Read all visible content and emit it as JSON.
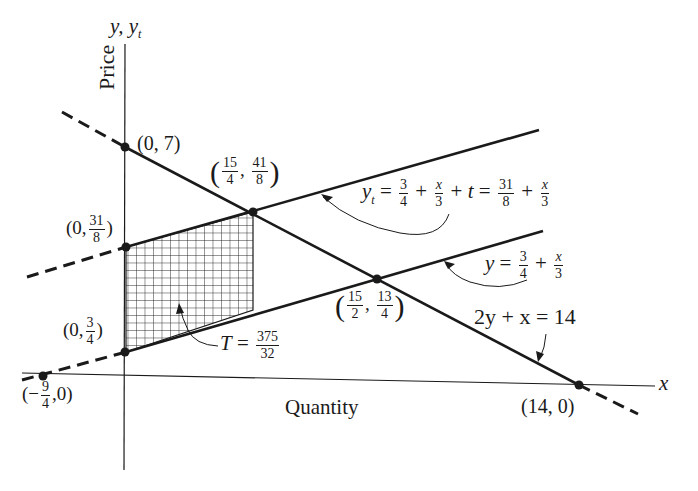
{
  "axes": {
    "y_label": "y,  y",
    "y_label_sub": "t",
    "y_title": "Price",
    "x_label": "x",
    "x_title": "Quantity"
  },
  "points": {
    "p07": {
      "text": "(0, 7)"
    },
    "p0_31_8": {
      "prefix": "(0,",
      "num": "31",
      "den": "8",
      "suffix": ")"
    },
    "p0_3_4": {
      "prefix": "(0,",
      "num": "3",
      "den": "4",
      "suffix": ")"
    },
    "pneg94": {
      "prefix": "(−",
      "num": "9",
      "den": "4",
      "suffix": ",0)"
    },
    "p15_4_41_8": {
      "num1": "15",
      "den1": "4",
      "num2": "41",
      "den2": "8"
    },
    "p15_2_13_4": {
      "num1": "15",
      "den1": "2",
      "num2": "13",
      "den2": "4"
    },
    "p140": {
      "text": "(14, 0)"
    }
  },
  "equations": {
    "yt": {
      "lhs": "y",
      "lhs_sub": "t",
      "eq": " = ",
      "f1n": "3",
      "f1d": "4",
      "plus1": " + ",
      "f2n": "x",
      "f2d": "3",
      "plus2": " + ",
      "t": "t",
      "eq2": " = ",
      "f3n": "31",
      "f3d": "8",
      "plus3": " + ",
      "f4n": "x",
      "f4d": "3"
    },
    "y": {
      "lhs": "y",
      "eq": " = ",
      "f1n": "3",
      "f1d": "4",
      "plus": " + ",
      "f2n": "x",
      "f2d": "3"
    },
    "demand": {
      "text": "2y + x = 14"
    },
    "T": {
      "lhs": "T",
      "eq": " = ",
      "num": "375",
      "den": "32"
    }
  },
  "colors": {
    "ink": "#1a1a1a",
    "background": "#ffffff"
  }
}
